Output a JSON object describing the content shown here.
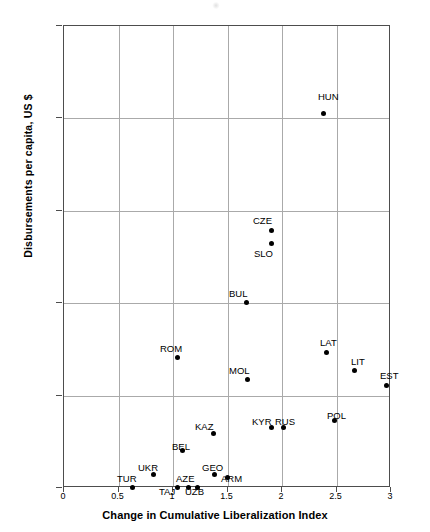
{
  "chart_data": {
    "type": "scatter",
    "title": "",
    "xlabel": "Change in Cumulative Liberalization Index",
    "ylabel": "Disbursements per capita, US $",
    "xlim": [
      0,
      3
    ],
    "ylim": [
      0,
      250
    ],
    "xticks": [
      "0",
      "0.5",
      "1",
      "1.5",
      "2",
      "2.5",
      "3"
    ],
    "xtick_values": [
      0,
      0.5,
      1,
      1.5,
      2,
      2.5,
      3
    ],
    "yticks": [
      "0",
      "50",
      "100",
      "150",
      "200",
      "250"
    ],
    "ytick_values": [
      0,
      50,
      100,
      150,
      200,
      250
    ],
    "grid": true,
    "legend": "none",
    "marker": "filled-diamond",
    "marker_color": "#000000",
    "points": [
      {
        "label": "HUN",
        "x": 2.39,
        "y": 202,
        "lx": 318,
        "ly": 92
      },
      {
        "label": "CZE",
        "x": 1.91,
        "y": 139,
        "lx": 253,
        "ly": 216
      },
      {
        "label": "SLO",
        "x": 1.91,
        "y": 132,
        "lx": 254,
        "ly": 249
      },
      {
        "label": "BUL",
        "x": 1.68,
        "y": 100,
        "lx": 229,
        "ly": 289
      },
      {
        "label": "LAT",
        "x": 2.42,
        "y": 73,
        "lx": 320,
        "ly": 338
      },
      {
        "label": "ROM",
        "x": 1.05,
        "y": 70,
        "lx": 160,
        "ly": 344
      },
      {
        "label": "LIT",
        "x": 2.67,
        "y": 63,
        "lx": 351,
        "ly": 357
      },
      {
        "label": "MOL",
        "x": 1.69,
        "y": 58,
        "lx": 229,
        "ly": 366
      },
      {
        "label": "EST",
        "x": 2.97,
        "y": 55,
        "lx": 380,
        "ly": 371
      },
      {
        "label": "POL",
        "x": 2.49,
        "y": 36,
        "lx": 327,
        "ly": 411
      },
      {
        "label": "RUS",
        "x": 2.02,
        "y": 32,
        "lx": 275,
        "ly": 417
      },
      {
        "label": "KYR",
        "x": 1.91,
        "y": 32,
        "lx": 252,
        "ly": 417
      },
      {
        "label": "KAZ",
        "x": 1.38,
        "y": 29,
        "lx": 195,
        "ly": 422
      },
      {
        "label": "BEL",
        "x": 1.1,
        "y": 20,
        "lx": 172,
        "ly": 442
      },
      {
        "label": "GEO",
        "x": 1.39,
        "y": 7,
        "lx": 202,
        "ly": 463
      },
      {
        "label": "UKR",
        "x": 0.83,
        "y": 7,
        "lx": 138,
        "ly": 463
      },
      {
        "label": "ARM",
        "x": 1.51,
        "y": 5,
        "lx": 221,
        "ly": 474
      },
      {
        "label": "AZE",
        "x": 1.15,
        "y": 0,
        "lx": 176,
        "ly": 474
      },
      {
        "label": "TUR",
        "x": 0.64,
        "y": 0,
        "lx": 117,
        "ly": 474
      },
      {
        "label": "TAJ",
        "x": 1.05,
        "y": 0,
        "lx": 159,
        "ly": 487
      },
      {
        "label": "UZB",
        "x": 1.23,
        "y": 0,
        "lx": 185,
        "ly": 487
      }
    ]
  }
}
